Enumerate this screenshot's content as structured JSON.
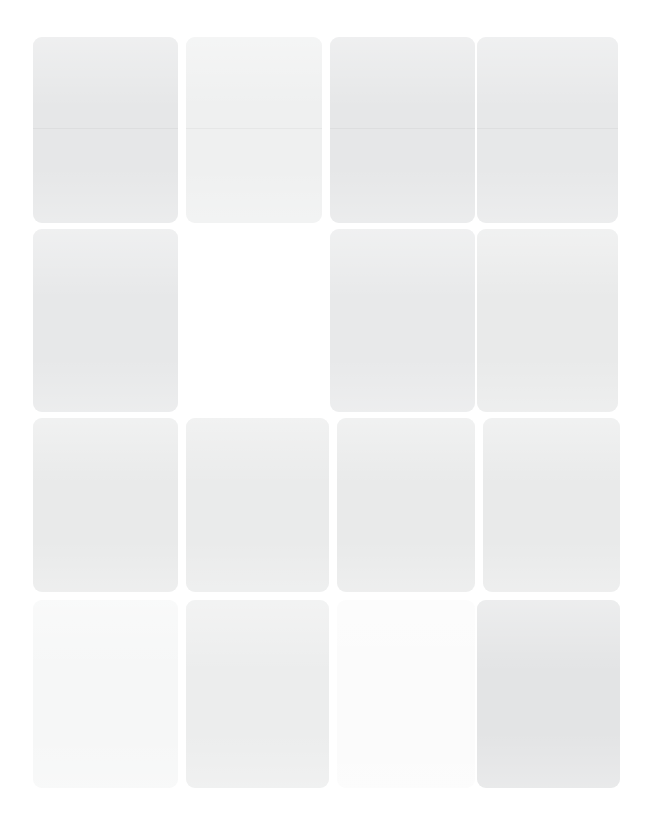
{
  "canvas": {
    "width": 650,
    "height": 839,
    "background": "#ffffff"
  },
  "grid": {
    "columns": 4,
    "rows": 4,
    "gap_x": 8,
    "gap_y": 6,
    "corner_radius": 9,
    "content_left": 33,
    "content_top": 37,
    "content_right": 620,
    "content_bottom": 788
  },
  "cards": [
    {
      "id": "card-r1c1",
      "row": 1,
      "col": 1,
      "x": 33,
      "y": 37,
      "w": 145,
      "h": 186,
      "fill": "#e6e7e8",
      "divider_y": 91,
      "empty": false
    },
    {
      "id": "card-r1c2",
      "row": 1,
      "col": 2,
      "x": 186,
      "y": 37,
      "w": 136,
      "h": 186,
      "fill": "#eff0f0",
      "divider_y": 91,
      "empty": false
    },
    {
      "id": "card-r1c3",
      "row": 1,
      "col": 3,
      "x": 330,
      "y": 37,
      "w": 145,
      "h": 186,
      "fill": "#e6e7e8",
      "divider_y": 91,
      "empty": false
    },
    {
      "id": "card-r1c4",
      "row": 1,
      "col": 4,
      "x": 477,
      "y": 37,
      "w": 141,
      "h": 186,
      "fill": "#e7e8e9",
      "divider_y": 91,
      "empty": false
    },
    {
      "id": "card-r2c1",
      "row": 2,
      "col": 1,
      "x": 33,
      "y": 229,
      "w": 145,
      "h": 183,
      "fill": "#e7e8e9",
      "divider_y": null,
      "empty": false
    },
    {
      "id": "card-r2c2",
      "row": 2,
      "col": 2,
      "x": 186,
      "y": 229,
      "w": 136,
      "h": 183,
      "fill": "#ffffff",
      "divider_y": null,
      "empty": true
    },
    {
      "id": "card-r2c3",
      "row": 2,
      "col": 3,
      "x": 330,
      "y": 229,
      "w": 145,
      "h": 183,
      "fill": "#e8e9ea",
      "divider_y": null,
      "empty": false
    },
    {
      "id": "card-r2c4",
      "row": 2,
      "col": 4,
      "x": 477,
      "y": 229,
      "w": 141,
      "h": 183,
      "fill": "#e9eaea",
      "divider_y": null,
      "empty": false
    },
    {
      "id": "card-r3c1",
      "row": 3,
      "col": 1,
      "x": 33,
      "y": 418,
      "w": 145,
      "h": 174,
      "fill": "#e9eaea",
      "divider_y": null,
      "empty": false
    },
    {
      "id": "card-r3c2",
      "row": 3,
      "col": 2,
      "x": 186,
      "y": 418,
      "w": 143,
      "h": 174,
      "fill": "#eaebeb",
      "divider_y": null,
      "empty": false
    },
    {
      "id": "card-r3c3",
      "row": 3,
      "col": 3,
      "x": 337,
      "y": 418,
      "w": 138,
      "h": 174,
      "fill": "#e9eaea",
      "divider_y": null,
      "empty": false
    },
    {
      "id": "card-r3c4",
      "row": 3,
      "col": 4,
      "x": 483,
      "y": 418,
      "w": 137,
      "h": 174,
      "fill": "#e9eaea",
      "divider_y": null,
      "empty": false
    },
    {
      "id": "card-r4c1",
      "row": 4,
      "col": 1,
      "x": 33,
      "y": 600,
      "w": 145,
      "h": 188,
      "fill": "#f6f7f7",
      "divider_y": null,
      "empty": false
    },
    {
      "id": "card-r4c2",
      "row": 4,
      "col": 2,
      "x": 186,
      "y": 600,
      "w": 143,
      "h": 188,
      "fill": "#eceded",
      "divider_y": null,
      "empty": false
    },
    {
      "id": "card-r4c3",
      "row": 4,
      "col": 3,
      "x": 337,
      "y": 600,
      "w": 138,
      "h": 188,
      "fill": "#fbfbfb",
      "divider_y": null,
      "empty": false
    },
    {
      "id": "card-r4c4",
      "row": 4,
      "col": 4,
      "x": 477,
      "y": 600,
      "w": 143,
      "h": 188,
      "fill": "#e3e4e5",
      "divider_y": null,
      "empty": false
    }
  ]
}
